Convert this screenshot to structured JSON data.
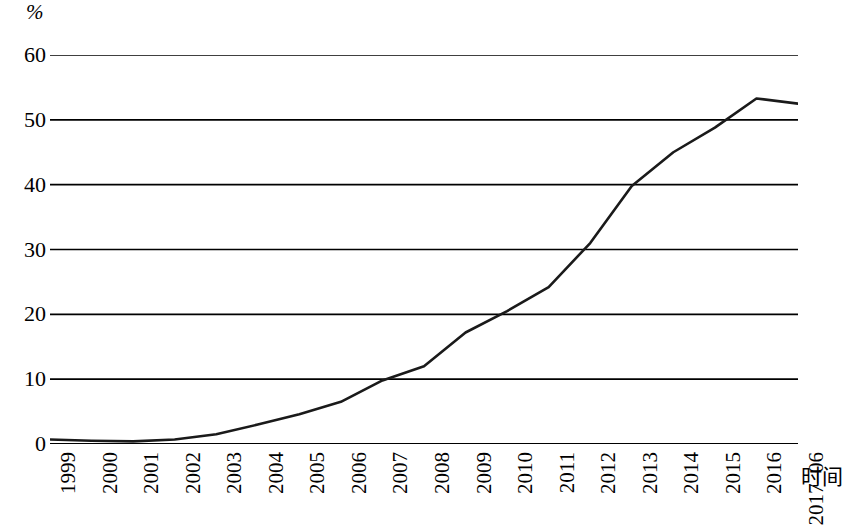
{
  "chart_data": {
    "type": "line",
    "title": "",
    "subtitle": "",
    "xlabel": "时间",
    "ylabel": "%",
    "y_unit_label": "%",
    "categories": [
      "1999",
      "2000",
      "2001",
      "2002",
      "2003",
      "2004",
      "2005",
      "2006",
      "2007",
      "2008",
      "2009",
      "2010",
      "2011",
      "2012",
      "2013",
      "2014",
      "2015",
      "2016",
      "2017-06"
    ],
    "x_tick_labels": [
      "1999",
      "2000",
      "2001",
      "2002",
      "2003",
      "2004",
      "2005",
      "2006",
      "2007",
      "2008",
      "2009",
      "2010",
      "2011",
      "2012",
      "2013",
      "2014",
      "2015",
      "2016",
      "2017–06"
    ],
    "values": [
      0.7,
      0.5,
      0.4,
      0.7,
      1.5,
      3.0,
      4.6,
      6.5,
      9.8,
      12.0,
      17.2,
      20.5,
      24.2,
      31.0,
      39.8,
      45.0,
      48.8,
      53.3,
      52.5
    ],
    "series": [
      {
        "name": "",
        "values": [
          0.7,
          0.5,
          0.4,
          0.7,
          1.5,
          3.0,
          4.6,
          6.5,
          9.8,
          12.0,
          17.2,
          20.5,
          24.2,
          31.0,
          39.8,
          45.0,
          48.8,
          53.3,
          52.5
        ]
      }
    ],
    "ylim": [
      0,
      60
    ],
    "y_ticks": [
      0,
      10,
      20,
      30,
      40,
      50,
      60
    ],
    "y_tick_labels": [
      "0",
      "10",
      "20",
      "30",
      "40",
      "50",
      "60"
    ],
    "grid": true,
    "grid_axis": "y",
    "legend": false,
    "legend_position": "none",
    "line_color": "#1a1a1a",
    "grid_color": "#000000",
    "axis_color": "#000000",
    "background_color": "#ffffff",
    "annotations": []
  }
}
